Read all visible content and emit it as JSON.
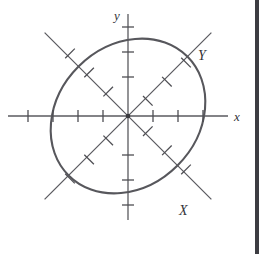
{
  "figure": {
    "kind": "rotated-conic-diagram",
    "background_color": "#ffffff",
    "curve_color": "#57575c",
    "axis_color": "#5a5a5f",
    "label_color": "#333338",
    "border_color": "#3d3d42",
    "labels": {
      "x_axis": "x",
      "y_axis": "y",
      "rotated_x_axis": "X",
      "rotated_y_axis": "Y"
    },
    "origin": {
      "x": 128,
      "y": 116
    },
    "rotation_degrees": 45,
    "ellipse": {
      "center_x": 128,
      "center_y": 116,
      "semi_major": 84,
      "semi_minor": 70,
      "tilt_degrees": -45
    },
    "axes": {
      "x": {
        "start_x": 8,
        "end_x": 228,
        "y": 116,
        "tick_count": 8,
        "tick_spacing": 25,
        "tick_half_length": 6
      },
      "y": {
        "x": 128,
        "start_y": 14,
        "end_y": 220,
        "tick_count": 7,
        "tick_spacing": 25,
        "tick_half_length": 6
      },
      "X": {
        "angle_degrees": -45,
        "half_length": 118,
        "tick_count": 6,
        "tick_spacing": 27,
        "tick_half_length": 7
      },
      "Y": {
        "angle_degrees": 45,
        "half_length": 118,
        "tick_count": 6,
        "tick_spacing": 27,
        "tick_half_length": 7
      }
    },
    "label_positions": {
      "x": {
        "x": 235,
        "y": 121
      },
      "y": {
        "x": 119,
        "y": 16
      },
      "X": {
        "x": 183,
        "y": 211
      },
      "Y": {
        "x": 200,
        "y": 56
      }
    }
  }
}
